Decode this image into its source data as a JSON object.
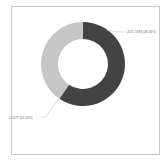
{
  "panel": {
    "border_color": "#c9c9c9",
    "background": "#ffffff"
  },
  "chart_data": {
    "type": "pie",
    "variant": "donut",
    "title": "",
    "subtitle": "",
    "xlabel": "",
    "ylabel": "",
    "grid": false,
    "legend_position": "none",
    "start_angle_deg": 0,
    "direction": "clockwise",
    "inner_radius_ratio": 0.6,
    "categories": [
      "2021",
      "0"
    ],
    "values": [
      1583,
      1077
    ],
    "percentages": [
      48.46,
      51.54
    ],
    "colors": [
      "#434343",
      "#c6c6c6"
    ],
    "labels": [
      "2021 1583 (48.46%)",
      "0 1077 (51.54%)"
    ],
    "slices": [
      {
        "name": "2021",
        "value": 1583,
        "percent": 48.46,
        "color": "#434343",
        "label": "2021 1583 (48.46%)",
        "label_position": "outside-top-right"
      },
      {
        "name": "0",
        "value": 1077,
        "percent": 51.54,
        "color": "#c6c6c6",
        "label": "0 1077 (51.54%)",
        "label_position": "outside-bottom-left"
      }
    ]
  },
  "geometry": {
    "center_x": 83,
    "center_y": 64,
    "outer_radius": 42,
    "inner_radius": 25
  },
  "leader_lines": {
    "color": "#b8b8b8"
  }
}
